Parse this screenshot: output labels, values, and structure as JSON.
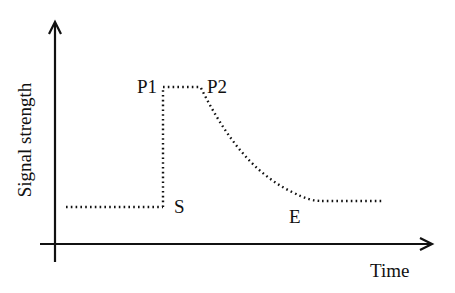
{
  "diagram": {
    "type": "signal-time-profile",
    "axes": {
      "x_label": "Time",
      "y_label": "Signal strength"
    },
    "points": {
      "s_label": "S",
      "p1_label": "P1",
      "p2_label": "P2",
      "e_label": "E"
    },
    "colors": {
      "line": "#111111",
      "background": "#ffffff"
    },
    "segments": [
      {
        "name": "baseline",
        "description": "flat low signal before S"
      },
      {
        "name": "rise",
        "description": "vertical jump from S to P1"
      },
      {
        "name": "plateau",
        "description": "flat high signal from P1 to P2"
      },
      {
        "name": "decay",
        "description": "curved decrease from P2 to E"
      },
      {
        "name": "tail",
        "description": "flat low signal after E"
      }
    ]
  }
}
